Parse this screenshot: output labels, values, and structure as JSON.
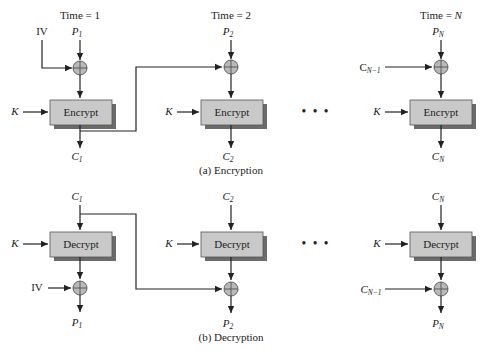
{
  "encryption": {
    "caption": "(a) Encryption",
    "stages": [
      {
        "time_label": "Time = 1",
        "plaintext": "P",
        "plaintext_sub": "1",
        "chain_input": "IV",
        "chain_sub": "",
        "key": "K",
        "box_label": "Encrypt",
        "ciphertext": "C",
        "ciphertext_sub": "1"
      },
      {
        "time_label": "Time = 2",
        "plaintext": "P",
        "plaintext_sub": "2",
        "key": "K",
        "box_label": "Encrypt",
        "ciphertext": "C",
        "ciphertext_sub": "2"
      },
      {
        "time_label": "Time = N",
        "plaintext": "P",
        "plaintext_sub": "N",
        "chain_input": "C",
        "chain_sub": "N−1",
        "key": "K",
        "box_label": "Encrypt",
        "ciphertext": "C",
        "ciphertext_sub": "N"
      }
    ],
    "ellipsis": "• • •"
  },
  "decryption": {
    "caption": "(b) Decryption",
    "stages": [
      {
        "ciphertext": "C",
        "ciphertext_sub": "1",
        "key": "K",
        "box_label": "Decrypt",
        "chain_input": "IV",
        "plaintext": "P",
        "plaintext_sub": "1"
      },
      {
        "ciphertext": "C",
        "ciphertext_sub": "2",
        "key": "K",
        "box_label": "Decrypt",
        "plaintext": "P",
        "plaintext_sub": "2"
      },
      {
        "ciphertext": "C",
        "ciphertext_sub": "N",
        "key": "K",
        "box_label": "Decrypt",
        "chain_input": "C",
        "chain_sub": "N−1",
        "plaintext": "P",
        "plaintext_sub": "N"
      }
    ],
    "ellipsis": "• • •"
  }
}
